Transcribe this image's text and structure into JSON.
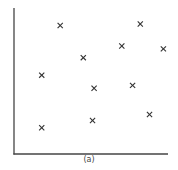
{
  "chart_data": {
    "type": "scatter",
    "title": "",
    "caption": "(a)",
    "xlabel": "",
    "ylabel": "",
    "grid": false,
    "legend": null,
    "marker": "x",
    "marker_color": "#333333",
    "axis_color": "#444444",
    "xlim": [
      0,
      100
    ],
    "ylim": [
      0,
      100
    ],
    "points": [
      {
        "x": 30,
        "y": 88
      },
      {
        "x": 82,
        "y": 89
      },
      {
        "x": 70,
        "y": 74
      },
      {
        "x": 97,
        "y": 72
      },
      {
        "x": 45,
        "y": 66
      },
      {
        "x": 18,
        "y": 54
      },
      {
        "x": 52,
        "y": 45
      },
      {
        "x": 77,
        "y": 47
      },
      {
        "x": 88,
        "y": 27
      },
      {
        "x": 51,
        "y": 23
      },
      {
        "x": 18,
        "y": 18
      }
    ]
  }
}
